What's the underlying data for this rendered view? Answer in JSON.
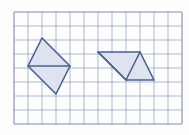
{
  "figure": {
    "background_color": "#fefeff",
    "canvas": {
      "width": 189,
      "height": 135
    }
  },
  "grid": {
    "name": "square-grid",
    "origin_x": 14,
    "origin_y": 12,
    "cell_size": 14,
    "columns": 12,
    "rows": 8,
    "line_color": "#9aa7c4",
    "line_width": 0.8,
    "border_color": "#7b8ab0",
    "border_width": 1.1
  },
  "shapes": [
    {
      "name": "rhombus-left",
      "label": "Rhombus",
      "kind": "rhombus",
      "points": "42,38 70,66 56,94 28,66",
      "fill": "#dde4f0",
      "stroke": "#4a5f96",
      "stroke_width": 1.6,
      "vertices": [
        {
          "name": "top-vertex",
          "x": 42,
          "y": 38
        },
        {
          "name": "right-vertex",
          "x": 70,
          "y": 66
        },
        {
          "name": "bottom-vertex",
          "x": 56,
          "y": 94
        },
        {
          "name": "left-vertex",
          "x": 28,
          "y": 66
        }
      ],
      "internal_lines": [
        {
          "name": "horizontal-diagonal",
          "x1": 28,
          "y1": 66,
          "x2": 70,
          "y2": 66
        }
      ]
    },
    {
      "name": "parallelogram-right",
      "label": "Parallelogram",
      "kind": "parallelogram",
      "points": "98,52 140,52 154,80 126,80",
      "fill": "#dde4f0",
      "stroke": "#4a5f96",
      "stroke_width": 1.6,
      "vertices": [
        {
          "name": "top-left-vertex",
          "x": 98,
          "y": 52
        },
        {
          "name": "top-right-vertex",
          "x": 140,
          "y": 52
        },
        {
          "name": "bottom-right-vertex",
          "x": 154,
          "y": 80
        },
        {
          "name": "bottom-left-vertex",
          "x": 126,
          "y": 80
        }
      ],
      "internal_lines": [
        {
          "name": "left-diagonal",
          "x1": 98,
          "y1": 52,
          "x2": 126,
          "y2": 80
        },
        {
          "name": "right-diagonal",
          "x1": 140,
          "y1": 52,
          "x2": 126,
          "y2": 80
        }
      ]
    }
  ]
}
